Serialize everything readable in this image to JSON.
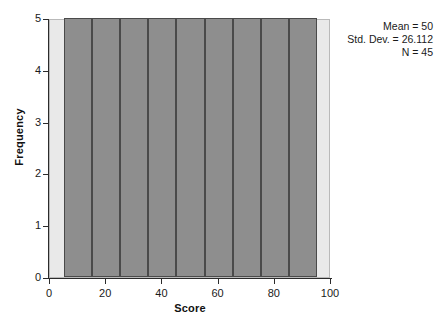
{
  "chart_data": {
    "type": "bar",
    "title": "",
    "subtitle": "",
    "xlabel": "Score",
    "ylabel": "Frequency",
    "xlim": [
      0,
      100
    ],
    "ylim": [
      0,
      5
    ],
    "grid": false,
    "legend": null,
    "bin_width": 10,
    "categories": [
      "5-15",
      "15-25",
      "25-35",
      "35-45",
      "45-55",
      "55-65",
      "65-75",
      "75-85",
      "85-95"
    ],
    "bin_edges": [
      5,
      15,
      25,
      35,
      45,
      55,
      65,
      75,
      85,
      95
    ],
    "bin_centers": [
      10,
      20,
      30,
      40,
      50,
      60,
      70,
      80,
      90
    ],
    "values": [
      5,
      5,
      5,
      5,
      5,
      5,
      5,
      5,
      5
    ],
    "xticks": [
      0,
      20,
      40,
      60,
      80,
      100
    ],
    "xtick_labels": [
      "0",
      "20",
      "40",
      "60",
      "80",
      "100"
    ],
    "yticks": [
      0,
      1,
      2,
      3,
      4,
      5
    ],
    "ytick_labels": [
      "0",
      "1",
      "2",
      "3",
      "4",
      "5"
    ],
    "annotations": [
      "Mean = 50",
      "Std. Dev. = 26.112",
      "N = 45"
    ],
    "colors": {
      "bar_fill": "#8e8e8e",
      "bar_edge": "#4a4a4a",
      "panel_background": "#e9e9e9",
      "panel_border": "#b9b9b9",
      "axis": "#2b2b2b",
      "text": "#1a1a1a"
    }
  },
  "stats": {
    "mean_label": "Mean = 50",
    "stddev_label": "Std. Dev. = 26.112",
    "n_label": "N = 45"
  },
  "axes": {
    "x_title": "Score",
    "y_title": "Frequency"
  }
}
